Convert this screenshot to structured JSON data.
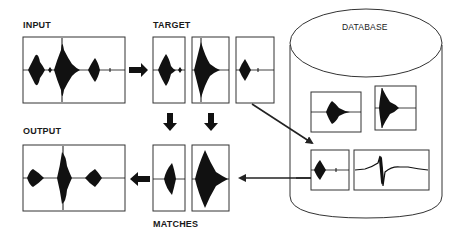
{
  "labels": {
    "input": "INPUT",
    "target": "TARGET",
    "output": "OUTPUT",
    "matches": "MATCHES",
    "database": "DATABASE"
  },
  "colors": {
    "stroke": "#333333",
    "waveform": "#111111",
    "background": "#ffffff"
  },
  "panels": {
    "input": {
      "x": 23,
      "y": 37,
      "w": 102,
      "h": 66
    },
    "target": [
      {
        "x": 153,
        "y": 37,
        "w": 32,
        "h": 66
      },
      {
        "x": 192,
        "y": 37,
        "w": 37,
        "h": 66
      },
      {
        "x": 236,
        "y": 37,
        "w": 38,
        "h": 66
      }
    ],
    "output": {
      "x": 23,
      "y": 145,
      "w": 102,
      "h": 66
    },
    "matches": [
      {
        "x": 153,
        "y": 145,
        "w": 32,
        "h": 66
      },
      {
        "x": 192,
        "y": 145,
        "w": 37,
        "h": 66
      }
    ],
    "database": [
      {
        "x": 311,
        "y": 92,
        "w": 50,
        "h": 40
      },
      {
        "x": 375,
        "y": 86,
        "w": 41,
        "h": 44
      },
      {
        "x": 311,
        "y": 150,
        "w": 38,
        "h": 40
      },
      {
        "x": 354,
        "y": 150,
        "w": 75,
        "h": 40
      }
    ]
  }
}
